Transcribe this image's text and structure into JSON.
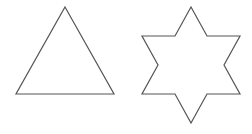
{
  "canvas": {
    "width": 252,
    "height": 134,
    "background": "#ffffff"
  },
  "stroke": {
    "color": "#555555",
    "width": 1.2
  },
  "shapes": [
    {
      "name": "triangle",
      "points": "65,7 114,94 16,94"
    },
    {
      "name": "six-pointed-star",
      "points": "191,7 207,36 240,36 224,65 240,94 207,94 191,123 175,94 142,94 158,65 142,36 175,36"
    }
  ]
}
